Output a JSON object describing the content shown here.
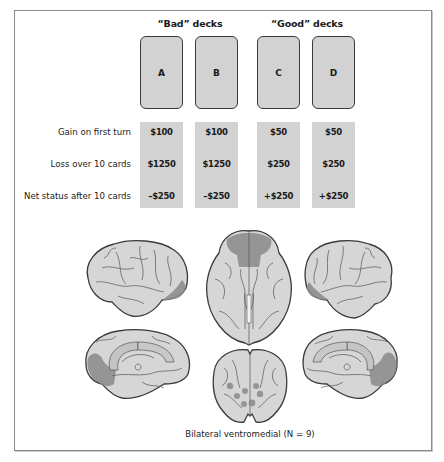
{
  "figure": {
    "groups": [
      {
        "label": "“Bad” decks"
      },
      {
        "label": "“Good” decks"
      }
    ],
    "decks": [
      {
        "label": "A",
        "gain_first_turn": "$100",
        "loss_10_cards": "$1250",
        "net_after_10": "–$250"
      },
      {
        "label": "B",
        "gain_first_turn": "$100",
        "loss_10_cards": "$1250",
        "net_after_10": "–$250"
      },
      {
        "label": "C",
        "gain_first_turn": "$50",
        "loss_10_cards": "$250",
        "net_after_10": "+$250"
      },
      {
        "label": "D",
        "gain_first_turn": "$50",
        "loss_10_cards": "$250",
        "net_after_10": "+$250"
      }
    ],
    "row_labels": {
      "gain": "Gain on first turn",
      "loss": "Loss over 10 cards",
      "net": "Net status after 10 cards"
    },
    "brain_views": [
      {
        "view": "left lateral",
        "lesion": "orbitofrontal pole"
      },
      {
        "view": "ventral",
        "lesion": "bilateral ventromedial prefrontal"
      },
      {
        "view": "right lateral",
        "lesion": "orbitofrontal pole"
      },
      {
        "view": "left medial",
        "lesion": "ventromedial prefrontal / anterior cingulate"
      },
      {
        "view": "coronal",
        "lesion": "bilateral ventromedial foci"
      },
      {
        "view": "right medial",
        "lesion": "ventromedial prefrontal / anterior cingulate"
      }
    ],
    "caption": "Bilateral ventromedial (N = 9)",
    "colors": {
      "card_fill": "#d2d2d2",
      "brain_fill": "#d6d6d6",
      "lesion": "#8a8a8a"
    }
  }
}
